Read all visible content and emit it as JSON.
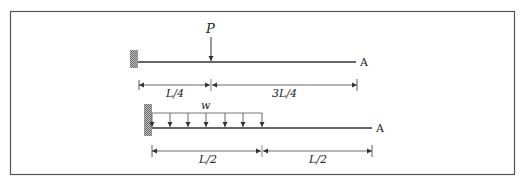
{
  "diagram": {
    "beam1": {
      "load_label": "P",
      "end_label": "A",
      "dimensions": [
        {
          "label": "L/4"
        },
        {
          "label": "3L/4"
        }
      ]
    },
    "beam2": {
      "load_label": "w",
      "end_label": "A",
      "dimensions": [
        {
          "label": "L/2"
        },
        {
          "label": "L/2"
        }
      ]
    },
    "colors": {
      "line": "#333333",
      "hatch": "#888888",
      "border": "#555555"
    }
  }
}
